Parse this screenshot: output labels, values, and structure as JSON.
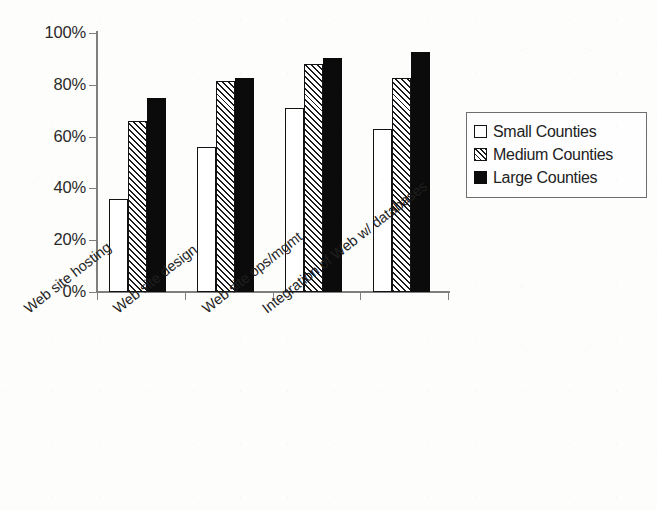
{
  "chart_data": {
    "type": "bar",
    "title": "",
    "subtitle": "",
    "xlabel": "",
    "ylabel": "",
    "ylim": [
      0,
      100
    ],
    "y_tick_labels": [
      "0%",
      "20%",
      "40%",
      "60%",
      "80%",
      "100%"
    ],
    "y_tick_values": [
      0,
      20,
      40,
      60,
      80,
      100
    ],
    "grid": false,
    "legend_position": "right",
    "value_unit": "%",
    "categories": [
      "Web site hosting",
      "Web site design",
      "Web site ops/mgmt",
      "Integration of Web w/ databases"
    ],
    "series": [
      {
        "name": "Small Counties",
        "style": "open-white",
        "color": "#ffffff",
        "values": [
          36,
          56,
          71,
          63
        ]
      },
      {
        "name": "Medium Counties",
        "style": "diagonal-hatch",
        "color": "#ffffff",
        "values": [
          66,
          81.5,
          88,
          82.5
        ]
      },
      {
        "name": "Large Counties",
        "style": "solid-black",
        "color": "#0b0b0b",
        "values": [
          75,
          82.5,
          90.5,
          92.5
        ]
      }
    ],
    "annotations": []
  },
  "legend": {
    "entries": [
      {
        "label": "Small Counties"
      },
      {
        "label": "Medium Counties"
      },
      {
        "label": "Large Counties"
      }
    ]
  },
  "colors": {
    "axis": "#7f7f7f",
    "bar_outline": "#131313",
    "text": "#1f1f1f",
    "background": "#fdfdfb"
  }
}
